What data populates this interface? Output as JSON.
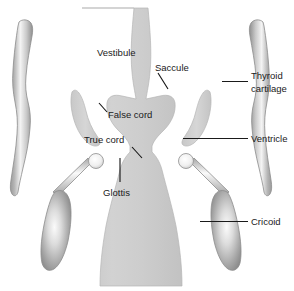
{
  "figure": {
    "background_color": "#ffffff",
    "text_color": "#1a1a1a",
    "airway_fill": "#cfcfcf",
    "cartilage_light": "#f2f2f2",
    "cartilage_mid": "#bdbdbd",
    "cartilage_dark": "#8e8e8e"
  },
  "labels": {
    "vestibule": "Vestibule",
    "saccule": "Saccule",
    "thyroid_cartilage_line1": "Thyroid",
    "thyroid_cartilage_line2": "cartilage",
    "false_cord": "False cord",
    "true_cord": "True cord",
    "ventricle": "Ventricle",
    "glottis": "Glottis",
    "cricoid": "Cricoid"
  },
  "structures": [
    {
      "name": "airway-lumen",
      "label": "Vestibule"
    },
    {
      "name": "saccule-left",
      "label": "Saccule"
    },
    {
      "name": "saccule-right",
      "label": "Saccule"
    },
    {
      "name": "thyroid-cartilage-left",
      "label": "Thyroid cartilage"
    },
    {
      "name": "thyroid-cartilage-right",
      "label": "Thyroid cartilage"
    },
    {
      "name": "cricoid-left",
      "label": "Cricoid"
    },
    {
      "name": "cricoid-right",
      "label": "Cricoid"
    },
    {
      "name": "arytenoid-left",
      "label": "Arytenoid"
    },
    {
      "name": "arytenoid-right",
      "label": "Arytenoid"
    }
  ]
}
